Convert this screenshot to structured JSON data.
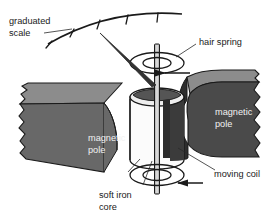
{
  "figure": {
    "background_color": "#ffffff",
    "width": 277,
    "height": 223
  },
  "labels": {
    "graduated_scale_line1": "graduated",
    "graduated_scale_line2": "scale",
    "hair_spring": "hair spring",
    "magnetic_pole_left_line1": "magnetic",
    "magnetic_pole_left_line2": "pole",
    "magnetic_pole_right_line1": "magnetic",
    "magnetic_pole_right_line2": "pole",
    "moving_coil": "moving coil",
    "soft_iron_core_line1": "soft iron",
    "soft_iron_core_line2": "core"
  },
  "colors": {
    "outline": "#1a1a1a",
    "leader": "#2a2a2a",
    "pole_face_dark": "#4a4a4a",
    "pole_face_mid": "#686868",
    "pole_top_light": "#8c8c8c",
    "pole_side_darkest": "#2e2e2e",
    "cylinder_body": "#fbfbfb",
    "cylinder_shade": "#3b3b3b",
    "core_top": "#555555",
    "spindle": "#b8b8b8",
    "pointer": "#333333",
    "label_dark": "#1a1a1a",
    "label_light": "#f2f2f2"
  },
  "scale": {
    "tick_count": 5,
    "arc_description": "curved graduated arc at top-left with tick marks"
  },
  "components": [
    {
      "name": "graduated-scale",
      "type": "arc-with-ticks"
    },
    {
      "name": "pointer-needle",
      "type": "tapered-needle"
    },
    {
      "name": "hair-spring-top",
      "type": "spiral-coil"
    },
    {
      "name": "hair-spring-bottom",
      "type": "spiral-coil"
    },
    {
      "name": "spindle",
      "type": "vertical-rod"
    },
    {
      "name": "moving-coil-cylinder",
      "type": "cylinder"
    },
    {
      "name": "soft-iron-core",
      "type": "inner-core"
    },
    {
      "name": "magnetic-pole-left",
      "type": "block"
    },
    {
      "name": "magnetic-pole-right",
      "type": "block"
    },
    {
      "name": "current-arrow",
      "type": "arrow-left"
    },
    {
      "name": "coil-arrow",
      "type": "arrow-right"
    }
  ]
}
